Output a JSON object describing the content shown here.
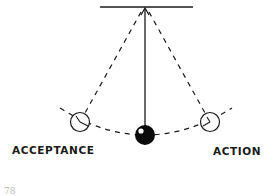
{
  "diagram": {
    "type": "pendulum",
    "labels": {
      "left": "ACCEPTANCE",
      "right": "ACTION"
    },
    "footer_fragment": "78",
    "colors": {
      "stroke": "#1a1a1a",
      "ball": "#0a0a0a",
      "highlight": "#ffffff",
      "background": "#ffffff"
    },
    "geometry": {
      "pivot": [
        145,
        7
      ],
      "bar": [
        100,
        193
      ],
      "ball_center": [
        145,
        135
      ],
      "ball_radius": 10,
      "left_ghost_center": [
        80,
        122
      ],
      "right_ghost_center": [
        210,
        122
      ],
      "ghost_radius": 9.5
    }
  }
}
